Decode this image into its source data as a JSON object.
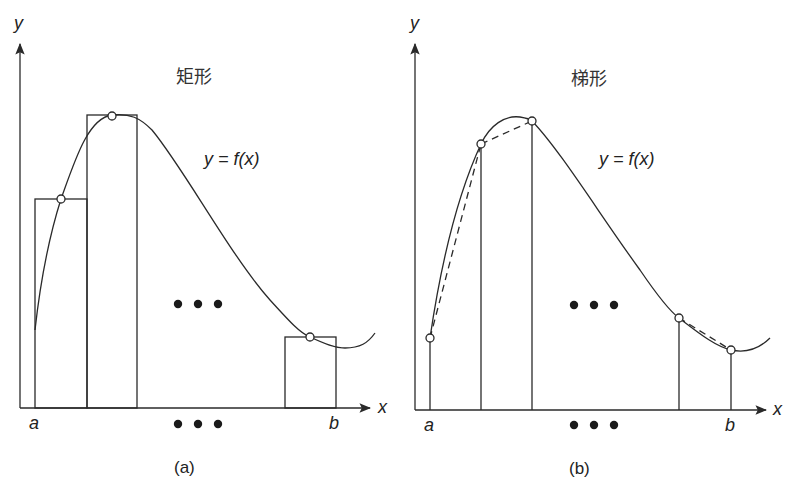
{
  "panels": [
    {
      "id": "a",
      "title": "矩形",
      "function_label": "y = f(x)",
      "axis_x_label": "x",
      "axis_y_label": "y",
      "left_bound": "a",
      "right_bound": "b",
      "ellipsis_middle": "• • •",
      "ellipsis_axis": "• • •",
      "caption": "(a)",
      "method": "rectangle"
    },
    {
      "id": "b",
      "title": "梯形",
      "function_label": "y = f(x)",
      "axis_x_label": "x",
      "axis_y_label": "y",
      "left_bound": "a",
      "right_bound": "b",
      "ellipsis_middle": "• • •",
      "ellipsis_axis": "• • •",
      "caption": "(b)",
      "method": "trapezoid"
    }
  ],
  "colors": {
    "line": "#2a2a2a",
    "background": "#ffffff"
  }
}
